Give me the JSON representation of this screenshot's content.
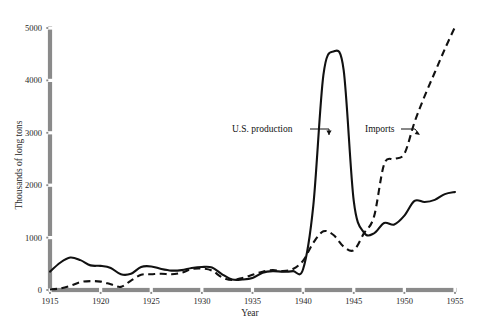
{
  "chart_data": {
    "type": "line",
    "title": "",
    "xlabel": "Year",
    "ylabel": "Thousands of long tons",
    "xlim": [
      1915,
      1955
    ],
    "ylim": [
      0,
      5000
    ],
    "grid": false,
    "legend_position": "inline-annotations",
    "xticks": [
      "1915",
      "1920",
      "1925",
      "1930",
      "1935",
      "1940",
      "1945",
      "1950",
      "1955"
    ],
    "xtick_values": [
      1915,
      1920,
      1925,
      1930,
      1935,
      1940,
      1945,
      1950,
      1955
    ],
    "yticks": [
      "0",
      "1000",
      "2000",
      "3000",
      "4000",
      "5000"
    ],
    "ytick_values": [
      0,
      1000,
      2000,
      3000,
      4000,
      5000
    ],
    "annotations": [
      {
        "text": "U.S. production",
        "series": "U.S. production",
        "x": 1942,
        "y": 2700
      },
      {
        "text": "Imports",
        "series": "Imports",
        "x": 1950,
        "y": 2700
      }
    ],
    "series": [
      {
        "name": "U.S. production",
        "style": "solid",
        "color": "#111111",
        "x": [
          1915,
          1916,
          1917,
          1918,
          1919,
          1920,
          1921,
          1922,
          1923,
          1924,
          1925,
          1926,
          1927,
          1928,
          1929,
          1930,
          1931,
          1932,
          1933,
          1934,
          1935,
          1936,
          1937,
          1938,
          1939,
          1940,
          1941,
          1942,
          1943,
          1944,
          1945,
          1946,
          1947,
          1948,
          1949,
          1950,
          1951,
          1952,
          1953,
          1954,
          1955
        ],
        "values": [
          350,
          520,
          620,
          570,
          470,
          460,
          420,
          300,
          310,
          440,
          450,
          400,
          370,
          380,
          420,
          440,
          430,
          300,
          200,
          200,
          230,
          330,
          360,
          350,
          360,
          400,
          1600,
          4100,
          4550,
          4200,
          1700,
          1100,
          1080,
          1280,
          1250,
          1420,
          1700,
          1680,
          1720,
          1830,
          1870
        ]
      },
      {
        "name": "Imports",
        "style": "dashed",
        "color": "#111111",
        "x": [
          1915,
          1916,
          1917,
          1918,
          1919,
          1920,
          1921,
          1922,
          1923,
          1924,
          1925,
          1926,
          1927,
          1928,
          1929,
          1930,
          1931,
          1932,
          1933,
          1934,
          1935,
          1936,
          1937,
          1938,
          1939,
          1940,
          1941,
          1942,
          1943,
          1944,
          1945,
          1946,
          1947,
          1948,
          1949,
          1950,
          1951,
          1952,
          1953,
          1954,
          1955
        ],
        "values": [
          10,
          30,
          80,
          150,
          170,
          160,
          110,
          60,
          180,
          290,
          300,
          310,
          300,
          330,
          400,
          410,
          370,
          240,
          190,
          230,
          290,
          350,
          380,
          360,
          400,
          560,
          900,
          1120,
          1050,
          830,
          760,
          1080,
          1400,
          2400,
          2500,
          2600,
          3200,
          3700,
          4150,
          4600,
          5020
        ]
      }
    ]
  },
  "axis": {
    "y_label": "Thousands of long tons",
    "x_label": "Year"
  },
  "colors": {
    "axis_bar": "#8a8a8a",
    "line": "#111111",
    "background": "#ffffff"
  }
}
